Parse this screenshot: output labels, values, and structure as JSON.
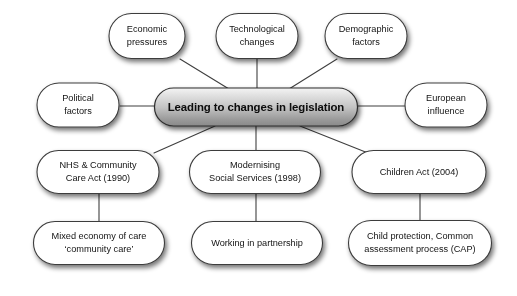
{
  "diagram": {
    "title": "Leading to changes in legislation",
    "type": "mind-map",
    "colors": {
      "node_fill": "#ffffff",
      "node_stroke": "#3c3c3c",
      "center_fill_top": "#f0f0f0",
      "center_fill_bottom": "#8f8f8f",
      "center_stroke": "#2e2e2e",
      "connector": "#3f3f3f",
      "text": "#131313",
      "background": "#ffffff"
    },
    "center_node": {
      "id": "center",
      "label": "Leading to changes in legislation",
      "x": 256,
      "y": 107,
      "w": 203,
      "h": 38
    },
    "nodes": [
      {
        "id": "economic-pressures",
        "label_line1": "Economic",
        "label_line2": "pressures",
        "x": 147,
        "y": 36,
        "w": 76,
        "h": 45
      },
      {
        "id": "technological-changes",
        "label_line1": "Technological",
        "label_line2": "changes",
        "x": 257,
        "y": 36,
        "w": 82,
        "h": 45
      },
      {
        "id": "demographic-factors",
        "label_line1": "Demographic",
        "label_line2": "factors",
        "x": 366,
        "y": 36,
        "w": 82,
        "h": 45
      },
      {
        "id": "political-factors",
        "label_line1": "Political",
        "label_line2": "factors",
        "x": 78,
        "y": 105,
        "w": 82,
        "h": 44
      },
      {
        "id": "european-influence",
        "label_line1": "European",
        "label_line2": "influence",
        "x": 446,
        "y": 105,
        "w": 82,
        "h": 44
      },
      {
        "id": "nhs-community-care-act",
        "label_line1": "NHS & Community",
        "label_line2": "Care Act (1990)",
        "x": 98,
        "y": 172,
        "w": 122,
        "h": 43
      },
      {
        "id": "modernising-social-services",
        "label_line1": "Modernising",
        "label_line2": "Social Services (1998)",
        "x": 255,
        "y": 172,
        "w": 131,
        "h": 43
      },
      {
        "id": "children-act",
        "label_line1": "Children Act (2004)",
        "label_line2": "",
        "x": 419,
        "y": 172,
        "w": 134,
        "h": 43
      },
      {
        "id": "mixed-economy-of-care",
        "label_line1": "Mixed economy of care",
        "label_line2": "‘community care’",
        "x": 99,
        "y": 243,
        "w": 131,
        "h": 43
      },
      {
        "id": "working-in-partnership",
        "label_line1": "Working in partnership",
        "label_line2": "",
        "x": 257,
        "y": 243,
        "w": 131,
        "h": 43
      },
      {
        "id": "child-protection-cap",
        "label_line1": "Child protection, Common",
        "label_line2": "assessment process (CAP)",
        "x": 420,
        "y": 243,
        "w": 143,
        "h": 45
      }
    ],
    "connectors": [
      {
        "id": "economic-to-center",
        "from": "economic-pressures",
        "to": "center",
        "x1": 180,
        "y1": 59,
        "x2": 229,
        "y2": 89
      },
      {
        "id": "technological-to-center",
        "from": "technological-changes",
        "to": "center",
        "x1": 257,
        "y1": 59,
        "x2": 257,
        "y2": 89
      },
      {
        "id": "demographic-to-center",
        "from": "demographic-factors",
        "to": "center",
        "x1": 337,
        "y1": 59,
        "x2": 289,
        "y2": 89
      },
      {
        "id": "political-to-center",
        "from": "political-factors",
        "to": "center",
        "x1": 120,
        "y1": 106,
        "x2": 155,
        "y2": 106
      },
      {
        "id": "european-to-center",
        "from": "european-influence",
        "to": "center",
        "x1": 358,
        "y1": 106,
        "x2": 405,
        "y2": 106
      },
      {
        "id": "center-to-nhs",
        "from": "center",
        "to": "nhs-community-care-act",
        "x1": 215,
        "y1": 126,
        "x2": 154,
        "y2": 153
      },
      {
        "id": "center-to-modernising",
        "from": "center",
        "to": "modernising-social-services",
        "x1": 256,
        "y1": 126,
        "x2": 256,
        "y2": 152
      },
      {
        "id": "center-to-children",
        "from": "center",
        "to": "children-act",
        "x1": 300,
        "y1": 126,
        "x2": 368,
        "y2": 153
      },
      {
        "id": "nhs-to-mixed-economy",
        "from": "nhs-community-care-act",
        "to": "mixed-economy-of-care",
        "x1": 99,
        "y1": 194,
        "x2": 99,
        "y2": 223
      },
      {
        "id": "modernising-to-working",
        "from": "modernising-social-services",
        "to": "working-in-partnership",
        "x1": 256,
        "y1": 194,
        "x2": 256,
        "y2": 223
      },
      {
        "id": "children-to-child-prot",
        "from": "children-act",
        "to": "child-protection-cap",
        "x1": 420,
        "y1": 194,
        "x2": 420,
        "y2": 222
      }
    ]
  }
}
